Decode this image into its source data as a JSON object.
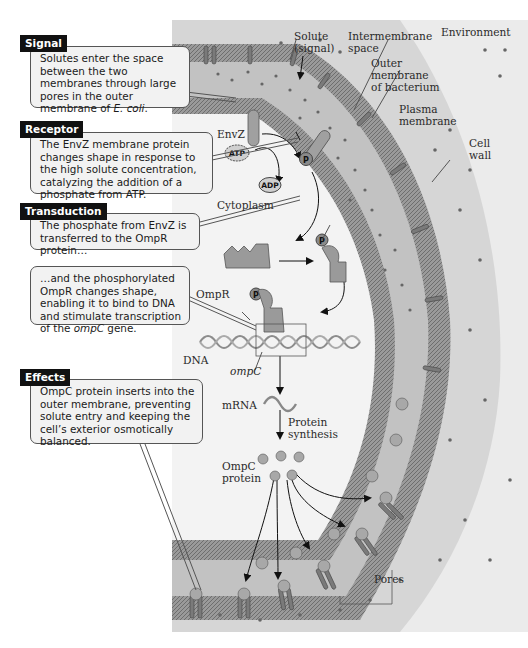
{
  "callouts": {
    "signal": {
      "tag": "Signal",
      "text_pre": "Solutes enter the space between the two membranes through large pores in the outer membrane of ",
      "text_italic": "E. coli",
      "text_post": "."
    },
    "receptor": {
      "tag": "Receptor",
      "text": "The EnvZ membrane protein changes shape in response to the high solute concentration, catalyzing the addition of a phosphate from ATP."
    },
    "transduction": {
      "tag": "Transduction",
      "text": "The phosphate from EnvZ is transferred to the OmpR protein…"
    },
    "transduction_2": {
      "text_pre": "…and the phosphorylated OmpR changes shape, enabling it to bind to DNA and stimulate transcription of the ",
      "text_italic": "ompC",
      "text_post": " gene."
    },
    "effects": {
      "tag": "Effects",
      "text": "OmpC protein inserts into the outer membrane, preventing solute entry and keeping the cell’s exterior osmotically balanced."
    }
  },
  "labels": {
    "solute_line1": "Solute",
    "solute_line2": "(signal)",
    "intermembrane_line1": "Intermembrane",
    "intermembrane_line2": "space",
    "environment": "Environment",
    "outer_line1": "Outer",
    "outer_line2": "membrane",
    "outer_line3": "of bacterium",
    "plasma_line1": "Plasma",
    "plasma_line2": "membrane",
    "cellwall_line1": "Cell",
    "cellwall_line2": "wall",
    "envz": "EnvZ",
    "atp": "ATP",
    "adp": "ADP",
    "phosphate": "P",
    "cytoplasm": "Cytoplasm",
    "ompr": "OmpR",
    "dna": "DNA",
    "ompc_gene": "ompC",
    "mrna": "mRNA",
    "protein_synthesis_line1": "Protein",
    "protein_synthesis_line2": "synthesis",
    "ompc_protein_line1": "OmpC",
    "ompc_protein_line2": "protein",
    "pores": "Pores"
  },
  "colors": {
    "background": "#ffffff",
    "cell_wall": "#d9d9d9",
    "environment": "#ebebeb",
    "membrane": "#8a8a8a",
    "intermembrane": "#c4c4c4",
    "cytoplasm": "#f0f0f0",
    "protein": "#9a9a9a",
    "callout_bg": "#f2f2f2",
    "tag_bg": "#111111"
  }
}
